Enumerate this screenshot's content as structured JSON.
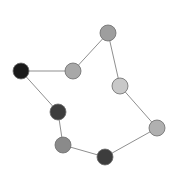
{
  "canvas": {
    "width": 180,
    "height": 183,
    "background": "#ffffff"
  },
  "chart_data": {
    "type": "scatter",
    "title": "",
    "subtitle": "",
    "xlabel": "",
    "ylabel": "",
    "xlim": [
      0,
      180
    ],
    "ylim": [
      0,
      183
    ],
    "grid": false,
    "legend": "none",
    "axes_visible": false,
    "tick_labels": [],
    "annotations": [],
    "graph": {
      "layout": "cycle",
      "node_count": 8,
      "edge_count": 8,
      "node_radius": 8,
      "edge_color": "#8f8f8f",
      "edge_width": 1,
      "node_stroke": "#6b6b6b",
      "nodes": [
        {
          "id": "n0",
          "label": "0",
          "x": 108,
          "y": 33,
          "r": 8,
          "color": "#9e9e9e"
        },
        {
          "id": "n1",
          "label": "1",
          "x": 73,
          "y": 71,
          "r": 8,
          "color": "#a8a8a8"
        },
        {
          "id": "n2",
          "label": "2",
          "x": 21,
          "y": 71,
          "r": 8,
          "color": "#1a1a1a"
        },
        {
          "id": "n3",
          "label": "3",
          "x": 58,
          "y": 112,
          "r": 8,
          "color": "#3d3d3d"
        },
        {
          "id": "n4",
          "label": "4",
          "x": 63,
          "y": 145,
          "r": 8,
          "color": "#8a8a8a"
        },
        {
          "id": "n5",
          "label": "5",
          "x": 105,
          "y": 157,
          "r": 8,
          "color": "#3d3d3d"
        },
        {
          "id": "n6",
          "label": "6",
          "x": 157,
          "y": 128,
          "r": 8,
          "color": "#b0b0b0"
        },
        {
          "id": "n7",
          "label": "7",
          "x": 120,
          "y": 86,
          "r": 8,
          "color": "#c8c8c8"
        }
      ],
      "edges": [
        {
          "source": "n0",
          "target": "n1"
        },
        {
          "source": "n1",
          "target": "n2"
        },
        {
          "source": "n2",
          "target": "n3"
        },
        {
          "source": "n3",
          "target": "n4"
        },
        {
          "source": "n4",
          "target": "n5"
        },
        {
          "source": "n5",
          "target": "n6"
        },
        {
          "source": "n6",
          "target": "n7"
        },
        {
          "source": "n7",
          "target": "n0"
        }
      ]
    }
  }
}
